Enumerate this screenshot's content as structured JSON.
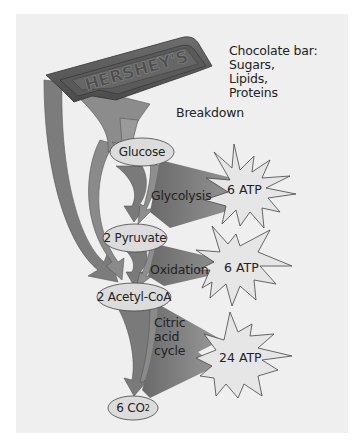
{
  "diagram": {
    "bar_brand": "HERSHEY'S",
    "source_label": {
      "line1": "Chocolate bar:",
      "line2": "Sugars,",
      "line3": "Lipids,",
      "line4": "Proteins"
    },
    "breakdown_label": "Breakdown",
    "nodes": {
      "glucose": "Glucose",
      "pyruvate": "2 Pyruvate",
      "acetyl_coa": "2 Acetyl-CoA",
      "co2_prefix": "6 CO",
      "co2_sub": "2"
    },
    "processes": {
      "glycolysis": "Glycolysis",
      "oxidation": "Oxidation",
      "citric_line1": "Citric",
      "citric_line2": "acid",
      "citric_line3": "cycle"
    },
    "atp_yields": [
      {
        "step": "Glycolysis",
        "label": "6 ATP"
      },
      {
        "step": "Oxidation",
        "label": "6 ATP"
      },
      {
        "step": "Citric acid cycle",
        "label": "24 ATP"
      }
    ],
    "colors": {
      "panel_bg": "#efefef",
      "arrow_fill": "#7a7a7a",
      "node_fill": "#dcdcdc",
      "star_fill": "#e6e6e6",
      "chocolate": "#5d5d5d"
    }
  }
}
